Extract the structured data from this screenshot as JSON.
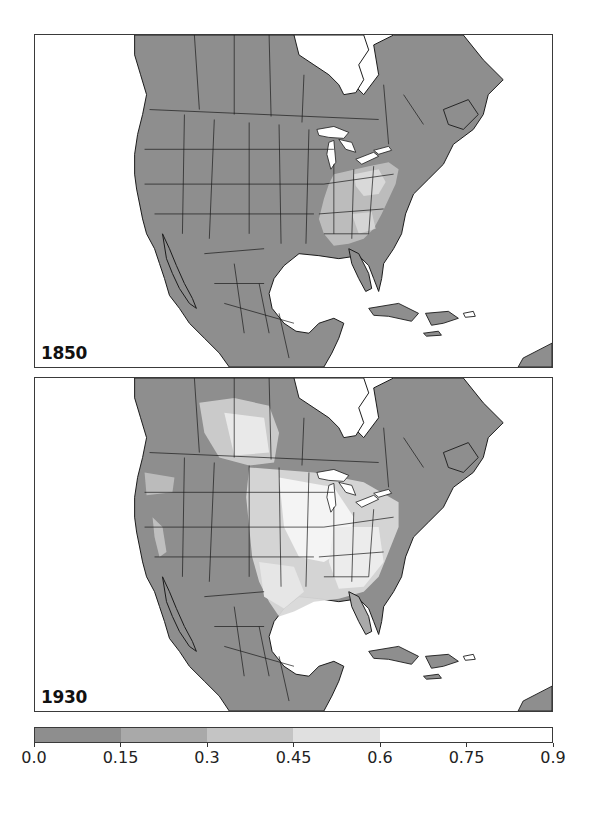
{
  "figure": {
    "panels": [
      {
        "id": "1850",
        "label": "1850"
      },
      {
        "id": "1930",
        "label": "1930"
      }
    ],
    "colors": {
      "land_low": "#8e8e8e",
      "water": "#ffffff",
      "border": "#1a1a1a"
    }
  },
  "colorbar": {
    "min": 0.0,
    "max": 0.9,
    "ticks": [
      "0.0",
      "0.15",
      "0.3",
      "0.45",
      "0.6",
      "0.75",
      "0.9"
    ],
    "tick_values": [
      0.0,
      0.15,
      0.3,
      0.45,
      0.6,
      0.75,
      0.9
    ],
    "segments": [
      {
        "from": 0.0,
        "to": 0.15,
        "color": "#8e8e8e"
      },
      {
        "from": 0.15,
        "to": 0.3,
        "color": "#a9a9a9"
      },
      {
        "from": 0.3,
        "to": 0.45,
        "color": "#c4c4c4"
      },
      {
        "from": 0.45,
        "to": 0.6,
        "color": "#e0e0e0"
      },
      {
        "from": 0.6,
        "to": 0.9,
        "color": "#ffffff"
      }
    ]
  },
  "chart_data": {
    "type": "heatmap",
    "title": "",
    "panels": [
      "1850",
      "1930"
    ],
    "region": "North America (Canada, USA, Mexico, Central America, Caribbean)",
    "colorbar": {
      "min": 0.0,
      "max": 0.9,
      "ticks": [
        0.0,
        0.15,
        0.3,
        0.45,
        0.6,
        0.75,
        0.9
      ]
    },
    "description": {
      "1850": "Mostly lowest class (0.0-0.15) everywhere; elevated values (0.3-0.6) in eastern US: Ohio, Pennsylvania, New York, Virginia, Carolinas, Georgia, Tennessee, Kentucky, Alabama, Mississippi.",
      "1930": "High values (0.45-0.9) across US Midwest, Great Plains, Texas, Southeast and Canadian prairies (Alberta/Saskatchewan); California Central Valley and Pacific Northwest moderately elevated; Mountain West, Mexico, northern Canada remain low."
    }
  }
}
